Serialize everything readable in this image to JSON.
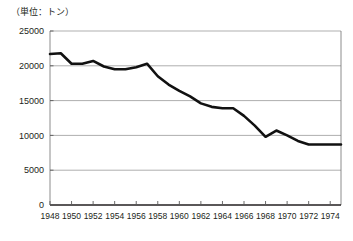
{
  "chart_data": {
    "type": "line",
    "title": "（単位：トン）",
    "xlabel": "",
    "ylabel": "",
    "unit": "トン",
    "grid": true,
    "legend": false,
    "legend_position": "none",
    "xlim": [
      1948,
      1975
    ],
    "ylim": [
      0,
      25000
    ],
    "ytick_labels": [
      "25000",
      "20000",
      "15000",
      "10000",
      "5000",
      "0"
    ],
    "ytick_values": [
      25000,
      20000,
      15000,
      10000,
      5000,
      0
    ],
    "xtick_labels": [
      "1948",
      "1950",
      "1952",
      "1954",
      "1956",
      "1958",
      "1960",
      "1962",
      "1964",
      "1966",
      "1968",
      "1970",
      "1972",
      "1974"
    ],
    "xtick_values": [
      1948,
      1950,
      1952,
      1954,
      1956,
      1958,
      1960,
      1962,
      1964,
      1966,
      1968,
      1970,
      1972,
      1974
    ],
    "x": [
      1948,
      1949,
      1950,
      1951,
      1952,
      1953,
      1954,
      1955,
      1956,
      1957,
      1958,
      1959,
      1960,
      1961,
      1962,
      1963,
      1964,
      1965,
      1966,
      1967,
      1968,
      1969,
      1970,
      1971,
      1972,
      1973,
      1974,
      1975
    ],
    "values": [
      21700,
      21800,
      20300,
      20300,
      20700,
      19900,
      19500,
      19500,
      19800,
      20300,
      18500,
      17300,
      16400,
      15600,
      14600,
      14100,
      13900,
      13900,
      12800,
      11400,
      9800,
      10700,
      10000,
      9200,
      8700,
      8700,
      8700,
      8700
    ],
    "series": [
      {
        "name": "",
        "color": "#111111",
        "values": [
          21700,
          21800,
          20300,
          20300,
          20700,
          19900,
          19500,
          19500,
          19800,
          20300,
          18500,
          17300,
          16400,
          15600,
          14600,
          14100,
          13900,
          13900,
          12800,
          11400,
          9800,
          10700,
          10000,
          9200,
          8700,
          8700,
          8700,
          8700
        ]
      }
    ]
  },
  "colors": {
    "line": "#111111",
    "grid": "#8d8d8d",
    "axis": "#231f20",
    "background": "#ffffff"
  }
}
